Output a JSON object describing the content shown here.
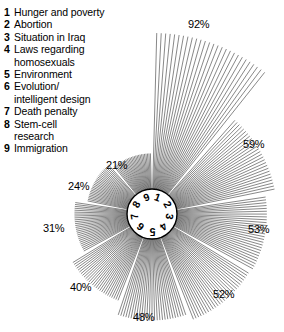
{
  "legend": {
    "items": [
      {
        "num": "1",
        "label": "Hunger and poverty"
      },
      {
        "num": "2",
        "label": "Abortion"
      },
      {
        "num": "3",
        "label": "Situation in Iraq"
      },
      {
        "num": "4",
        "label": "Laws regarding\nhomosexuals"
      },
      {
        "num": "5",
        "label": "Environment"
      },
      {
        "num": "6",
        "label": "Evolution/\nintelligent design"
      },
      {
        "num": "7",
        "label": "Death penalty"
      },
      {
        "num": "8",
        "label": "Stem-cell\nresearch"
      },
      {
        "num": "9",
        "label": "Immigration"
      }
    ]
  },
  "hub": {
    "digits": [
      "1",
      "2",
      "3",
      "4",
      "5",
      "6",
      "7",
      "8",
      "9"
    ]
  },
  "pct_labels": [
    {
      "text": "92%",
      "x": 188,
      "y": 18
    },
    {
      "text": "59%",
      "x": 243,
      "y": 138
    },
    {
      "text": "53%",
      "x": 248,
      "y": 223
    },
    {
      "text": "52%",
      "x": 213,
      "y": 288
    },
    {
      "text": "48%",
      "x": 133,
      "y": 311
    },
    {
      "text": "40%",
      "x": 70,
      "y": 281
    },
    {
      "text": "31%",
      "x": 43,
      "y": 222
    },
    {
      "text": "24%",
      "x": 68,
      "y": 180
    },
    {
      "text": "21%",
      "x": 106,
      "y": 159
    }
  ],
  "chart_data": {
    "type": "bar",
    "subtype": "radial-ray-rose",
    "title": "",
    "categories": [
      "Hunger and poverty",
      "Abortion",
      "Situation in Iraq",
      "Laws regarding homosexuals",
      "Environment",
      "Evolution/intelligent design",
      "Death penalty",
      "Stem-cell research",
      "Immigration"
    ],
    "category_numbers": [
      "1",
      "2",
      "3",
      "4",
      "5",
      "6",
      "7",
      "8",
      "9"
    ],
    "values": [
      92,
      59,
      53,
      52,
      48,
      40,
      31,
      24,
      21
    ],
    "value_labels": [
      "92%",
      "59%",
      "53%",
      "52%",
      "48%",
      "40%",
      "31%",
      "24%",
      "21%"
    ],
    "unit": "%",
    "xlabel": "",
    "ylabel": "",
    "ylim": [
      0,
      92
    ],
    "grid": false,
    "legend_position": "top-left",
    "ray_color": "#555555",
    "hub_outline_color": "#000000",
    "background": "#ffffff"
  },
  "geometry": {
    "center_x": 152,
    "center_y": 214,
    "hub_radius": 25,
    "max_ray_px": 181,
    "sector_gap_deg": 3,
    "start_angle_deg": -90,
    "ray_spacing_deg": 1.45
  }
}
